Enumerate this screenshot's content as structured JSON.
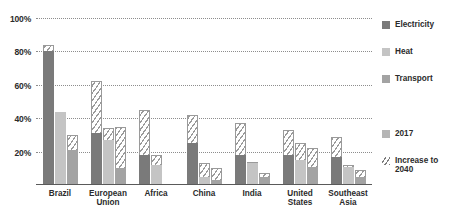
{
  "chart_data": {
    "type": "bar",
    "title": "",
    "subtitle": "",
    "xlabel": "",
    "ylabel": "",
    "ylim": [
      0,
      100
    ],
    "grid": true,
    "y_ticks": [
      100,
      80,
      60,
      40,
      20
    ],
    "y_tick_labels": [
      "100%",
      "80%",
      "60%",
      "40%",
      "20%"
    ],
    "categories": [
      "Brazil",
      "European\nUnion",
      "Africa",
      "China",
      "India",
      "United\nStates",
      "Southeast\nAsia"
    ],
    "series": [
      {
        "name": "Electricity",
        "color": "#7a7a7a",
        "values_2017": [
          80,
          31,
          18,
          25,
          18,
          18,
          17
        ],
        "values_2040": [
          84,
          62,
          45,
          42,
          37,
          33,
          29
        ]
      },
      {
        "name": "Heat",
        "color": "#c4c4c4",
        "values_2017": [
          44,
          27,
          12,
          5,
          13,
          15,
          11
        ],
        "values_2040": [
          44,
          34,
          18,
          13,
          14,
          25,
          12
        ]
      },
      {
        "name": "Transport",
        "color": "#a3a3a3",
        "values_2017": [
          21,
          10,
          0,
          3,
          5,
          11,
          5
        ],
        "values_2040": [
          30,
          35,
          0,
          10,
          7,
          22,
          9
        ]
      }
    ],
    "legend_position": "right",
    "legend": {
      "series_entries": [
        {
          "label": "Electricity",
          "color": "#7a7a7a",
          "pattern": "solid"
        },
        {
          "label": "Heat",
          "color": "#c4c4c4",
          "pattern": "solid"
        },
        {
          "label": "Transport",
          "color": "#a3a3a3",
          "pattern": "solid"
        }
      ],
      "pattern_entries": [
        {
          "label": "2017",
          "color": "#b5b5b5",
          "pattern": "solid"
        },
        {
          "label": "Increase to\n2040",
          "color": "#7d7d7d",
          "pattern": "hatched"
        }
      ]
    }
  }
}
